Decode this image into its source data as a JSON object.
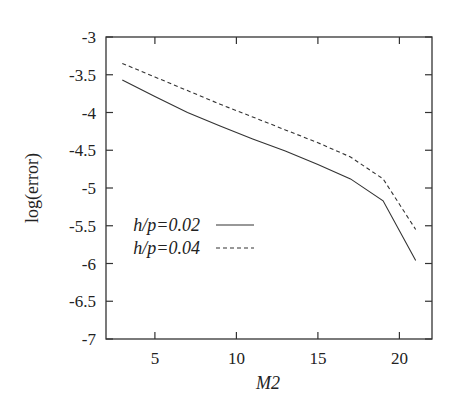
{
  "chart_data": {
    "type": "line",
    "title": "",
    "xlabel": "M2",
    "ylabel": "log(error)",
    "xlim": [
      2,
      22
    ],
    "ylim": [
      -7,
      -3
    ],
    "xticks": [
      5,
      10,
      15,
      20
    ],
    "xtick_labels": [
      "5",
      "10",
      "15",
      "20"
    ],
    "yticks": [
      -3,
      -3.5,
      -4,
      -4.5,
      -5,
      -5.5,
      -6,
      -6.5,
      -7
    ],
    "ytick_labels": [
      "-3",
      "-3.5",
      "-4",
      "-4.5",
      "-5",
      "-5.5",
      "-6",
      "-6.5",
      "-7"
    ],
    "grid": false,
    "legend_position": "center-left inside plot",
    "x": [
      3,
      5,
      7,
      9,
      11,
      13,
      15,
      17,
      19,
      21
    ],
    "series": [
      {
        "name": "h/p=0.02",
        "style": "solid",
        "color": "#333333",
        "values": [
          -3.57,
          -3.79,
          -4.0,
          -4.18,
          -4.35,
          -4.51,
          -4.69,
          -4.88,
          -5.17,
          -5.96
        ]
      },
      {
        "name": "h/p=0.04",
        "style": "dashed",
        "color": "#333333",
        "values": [
          -3.35,
          -3.53,
          -3.71,
          -3.89,
          -4.06,
          -4.23,
          -4.4,
          -4.59,
          -4.88,
          -5.55
        ]
      }
    ]
  },
  "plot": {
    "left": 106,
    "right": 432,
    "top": 37,
    "bottom": 339
  }
}
